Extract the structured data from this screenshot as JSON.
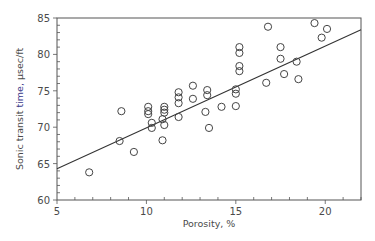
{
  "chart_data": {
    "type": "scatter",
    "title": "",
    "xlabel": "Porosity, %",
    "ylabel": "Sonic transit time,  µsec/ft",
    "ylabel_parts": [
      "Sonic transit ",
      "time,",
      "  µsec/ft"
    ],
    "xlim": [
      5,
      22
    ],
    "ylim": [
      60,
      85
    ],
    "xticks": [
      5,
      10,
      15,
      20
    ],
    "yticks": [
      60,
      65,
      70,
      75,
      80,
      85
    ],
    "x_minor_step": 1,
    "y_minor_step": 1,
    "grid": false,
    "legend": null,
    "series": [
      {
        "name": "measurements",
        "marker": "open-circle",
        "points": [
          [
            6.8,
            63.8
          ],
          [
            8.5,
            68.1
          ],
          [
            8.6,
            72.2
          ],
          [
            9.3,
            66.6
          ],
          [
            10.1,
            72.8
          ],
          [
            10.1,
            72.2
          ],
          [
            10.1,
            71.8
          ],
          [
            10.3,
            70.6
          ],
          [
            10.3,
            69.9
          ],
          [
            11.0,
            72.8
          ],
          [
            11.0,
            72.4
          ],
          [
            11.0,
            72.0
          ],
          [
            10.9,
            71.1
          ],
          [
            11.0,
            70.3
          ],
          [
            10.9,
            68.2
          ],
          [
            11.8,
            74.8
          ],
          [
            11.8,
            74.1
          ],
          [
            11.8,
            73.3
          ],
          [
            11.8,
            71.4
          ],
          [
            12.6,
            75.7
          ],
          [
            12.6,
            73.9
          ],
          [
            13.4,
            75.1
          ],
          [
            13.4,
            74.4
          ],
          [
            13.3,
            72.1
          ],
          [
            13.5,
            69.9
          ],
          [
            14.2,
            72.8
          ],
          [
            15.0,
            72.9
          ],
          [
            15.0,
            75.2
          ],
          [
            15.0,
            74.6
          ],
          [
            15.2,
            81.0
          ],
          [
            15.2,
            80.2
          ],
          [
            15.2,
            78.4
          ],
          [
            15.2,
            77.7
          ],
          [
            16.8,
            83.8
          ],
          [
            16.7,
            76.1
          ],
          [
            17.5,
            81.0
          ],
          [
            17.5,
            79.4
          ],
          [
            17.7,
            77.3
          ],
          [
            18.4,
            79.0
          ],
          [
            18.5,
            76.6
          ],
          [
            19.4,
            84.3
          ],
          [
            19.8,
            82.3
          ],
          [
            20.1,
            83.5
          ]
        ]
      },
      {
        "name": "regression-line",
        "type": "line",
        "points": [
          [
            5,
            64.3
          ],
          [
            22,
            83.4
          ]
        ]
      }
    ],
    "colors": {
      "axis": "#555555",
      "marker": "#444444",
      "line": "#333333",
      "text": "#4a4a4a",
      "accent": "#3a3a8a"
    }
  }
}
